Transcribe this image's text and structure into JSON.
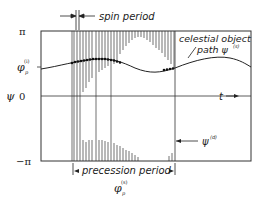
{
  "diagram": {
    "type": "phase plot",
    "y_axis": {
      "label": "ψ",
      "ticks": [
        {
          "label": "π",
          "sub": ""
        },
        {
          "label": "φ",
          "sub": "p",
          "sup": "(i)"
        },
        {
          "label": "0",
          "sub": ""
        },
        {
          "label": "−π",
          "sub": ""
        }
      ]
    },
    "x_axis": {
      "label": "t",
      "arrow": "→"
    },
    "annotations": {
      "spin_period": "spin period",
      "celestial_line1": "celestial object",
      "celestial_line2": "path ψ",
      "celestial_sup": "(s)",
      "psi_d": "ψ",
      "psi_d_sup": "(d)",
      "precession_period": "precession period",
      "phi_bottom": "φ",
      "phi_bottom_sub": "p",
      "phi_bottom_sup": "(s)"
    },
    "colors": {
      "ink": "#222222",
      "background": "#ffffff"
    }
  }
}
